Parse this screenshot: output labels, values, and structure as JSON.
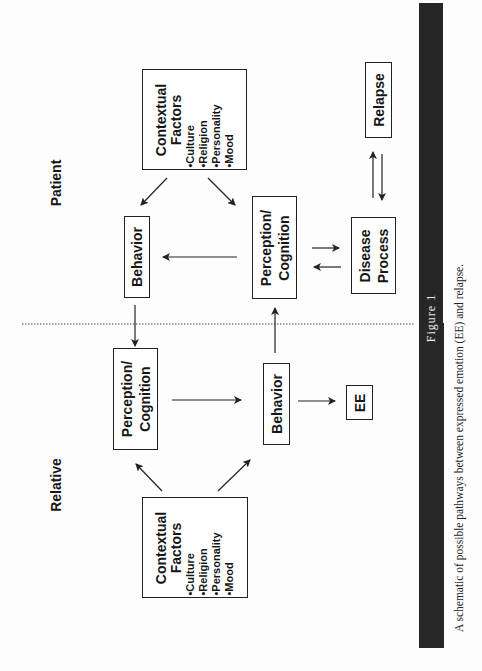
{
  "figure": {
    "label": "Figure 1",
    "caption": "A schematic of possible pathways between expressed emotion (EE) and relapse."
  },
  "sections": {
    "patient": "Patient",
    "relative": "Relative"
  },
  "nodes": {
    "patient_contextual": {
      "title_line1": "Contextual",
      "title_line2": "Factors",
      "items": [
        "•Culture",
        "•Religion",
        "•Personality",
        "•Mood"
      ]
    },
    "patient_behavior": {
      "label": "Behavior"
    },
    "patient_perception": {
      "line1": "Perception/",
      "line2": "Cognition"
    },
    "disease_process": {
      "line1": "Disease",
      "line2": "Process"
    },
    "relapse": {
      "label": "Relapse"
    },
    "relative_perception": {
      "line1": "Perception/",
      "line2": "Cognition"
    },
    "relative_behavior": {
      "label": "Behavior"
    },
    "ee": {
      "label": "EE"
    },
    "relative_contextual": {
      "title_line1": "Contextual",
      "title_line2": "Factors",
      "items": [
        "•Culture",
        "•Religion",
        "•Personality",
        "•Mood"
      ]
    }
  },
  "edges": [
    {
      "from": "patient_contextual",
      "to": "patient_behavior"
    },
    {
      "from": "patient_contextual",
      "to": "patient_perception"
    },
    {
      "from": "patient_perception",
      "to": "patient_behavior"
    },
    {
      "from": "patient_perception",
      "to": "disease_process"
    },
    {
      "from": "disease_process",
      "to": "patient_perception"
    },
    {
      "from": "disease_process",
      "to": "relapse"
    },
    {
      "from": "relapse",
      "to": "disease_process"
    },
    {
      "from": "patient_behavior",
      "to": "relative_perception"
    },
    {
      "from": "relative_behavior",
      "to": "patient_perception"
    },
    {
      "from": "relative_perception",
      "to": "relative_behavior"
    },
    {
      "from": "relative_behavior",
      "to": "ee"
    },
    {
      "from": "relative_contextual",
      "to": "relative_perception"
    },
    {
      "from": "relative_contextual",
      "to": "relative_behavior"
    }
  ]
}
